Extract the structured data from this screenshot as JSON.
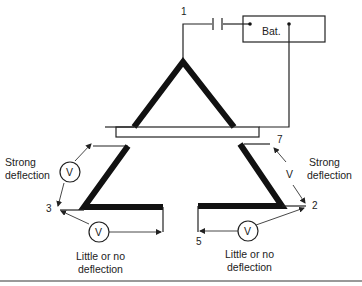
{
  "diagram": {
    "battery_label": "Bat.",
    "meter_symbol": "V",
    "points": {
      "p1": "1",
      "p2": "2",
      "p3": "3",
      "p5": "5",
      "p7": "7"
    },
    "annotations": {
      "left_strong_line1": "Strong",
      "left_strong_line2": "deflection",
      "right_strong_line1": "Strong",
      "right_strong_line2": "deflection",
      "left_little_line1": "Little or no",
      "left_little_line2": "deflection",
      "right_little_line1": "Little or no",
      "right_little_line2": "deflection"
    }
  }
}
